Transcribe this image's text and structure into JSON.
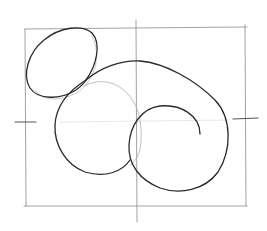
{
  "image": {
    "description": "Pencil sketch: construction frame with center lines and three overlapping curves (small ellipse, circle, spiral)",
    "stroke_color": "#2a2a2a",
    "guide_color": "#8a8a8a",
    "background": "#ffffff"
  },
  "shapes": {
    "frame": "construction-rectangle",
    "center_line": "vertical-center-guide",
    "small_ellipse": "top-left-ellipse",
    "circle": "middle-circle",
    "spiral": "right-spiral"
  }
}
